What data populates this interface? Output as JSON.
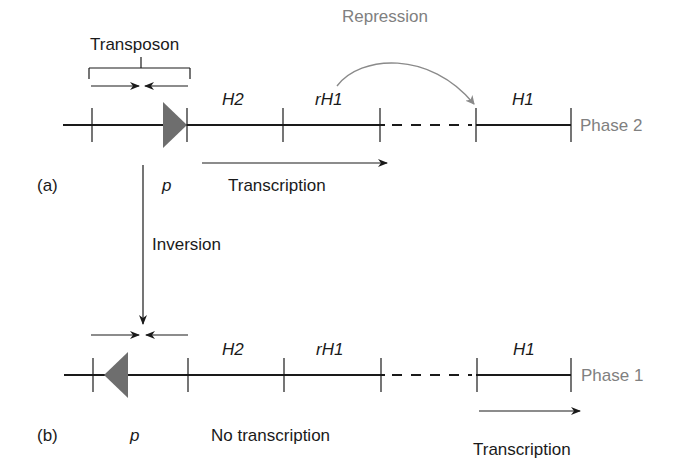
{
  "colors": {
    "line": "#1a1a1a",
    "promoter": "#6e6e6e",
    "repression": "#808080",
    "phase_label": "#808080"
  },
  "panel_a": {
    "label": "(a)",
    "transposon_label": "Transposon",
    "promoter_label": "p",
    "genes": [
      "H2",
      "rH1",
      "H1"
    ],
    "phase_label": "Phase 2",
    "transcription_label": "Transcription",
    "repression_label": "Repression"
  },
  "inversion_label": "Inversion",
  "panel_b": {
    "label": "(b)",
    "promoter_label": "p",
    "genes": [
      "H2",
      "rH1",
      "H1"
    ],
    "phase_label": "Phase 1",
    "no_transcription_label": "No transcription",
    "transcription_label": "Transcription"
  }
}
